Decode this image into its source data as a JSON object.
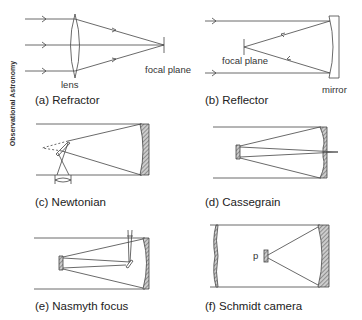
{
  "side_label": "Observational Astronomy",
  "panels": [
    {
      "id": "a",
      "caption": "(a) Refractor",
      "labels": {
        "lens": "lens",
        "focal_plane": "focal plane"
      }
    },
    {
      "id": "b",
      "caption": "(b) Reflector",
      "labels": {
        "focal_plane": "focal plane",
        "mirror": "mirror"
      }
    },
    {
      "id": "c",
      "caption": "(c) Newtonian"
    },
    {
      "id": "d",
      "caption": "(d) Cassegrain"
    },
    {
      "id": "e",
      "caption": "(e) Nasmyth focus"
    },
    {
      "id": "f",
      "caption": "(f) Schmidt camera",
      "labels": {
        "p": "p"
      }
    }
  ],
  "colors": {
    "line": "#444444",
    "mirror_fill": "#888888"
  }
}
